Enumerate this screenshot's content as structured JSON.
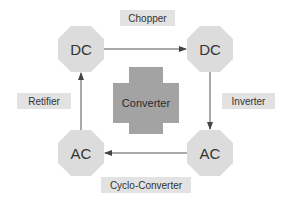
{
  "diagram": {
    "center": {
      "label": "Converter",
      "color": "#a3a3a3"
    },
    "nodes": [
      {
        "id": "dc-left",
        "label": "DC"
      },
      {
        "id": "dc-right",
        "label": "DC"
      },
      {
        "id": "ac-left",
        "label": "AC"
      },
      {
        "id": "ac-right",
        "label": "AC"
      }
    ],
    "edges": [
      {
        "from": "dc-left",
        "to": "dc-right",
        "label": "Chopper"
      },
      {
        "from": "dc-right",
        "to": "ac-right",
        "label": "Inverter"
      },
      {
        "from": "ac-right",
        "to": "ac-left",
        "label": "Cyclo-Converter"
      },
      {
        "from": "ac-left",
        "to": "dc-left",
        "label": "Retifier"
      }
    ],
    "colors": {
      "node_fill": "#dcdcdc",
      "tag_fill": "#e2e2e2",
      "line": "#555555"
    }
  }
}
